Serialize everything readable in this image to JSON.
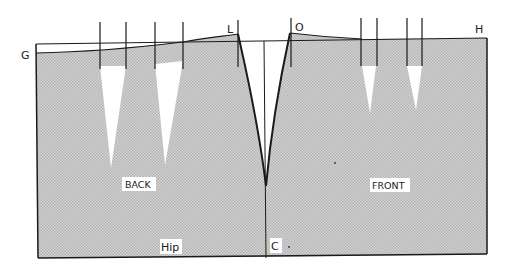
{
  "diagram": {
    "points": {
      "G": "G",
      "L": "L",
      "O": "O",
      "H": "H",
      "C": "C"
    },
    "panels": {
      "back": "BACK",
      "front": "FRONT"
    },
    "hip_label": "Hip",
    "colors": {
      "fill": "#c8c8c8",
      "line": "#1a1a1a",
      "dart": "#ffffff",
      "background": "#ffffff"
    }
  }
}
